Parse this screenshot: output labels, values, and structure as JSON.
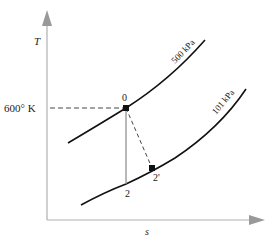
{
  "diagram": {
    "type": "T-s diagram",
    "axes": {
      "y_label": "T",
      "x_label": "s",
      "axis_color": "#aaaaaa"
    },
    "temperature_marker": {
      "label": "600° K"
    },
    "curves": [
      {
        "label": "500 kPa",
        "color": "#111111"
      },
      {
        "label": "101 kPa",
        "color": "#111111"
      }
    ],
    "points": [
      {
        "label": "0"
      },
      {
        "label": "2"
      },
      {
        "label": "2'"
      }
    ],
    "colors": {
      "curve": "#111111",
      "isentropic_line": "#888888",
      "dashed": "#444444"
    }
  }
}
